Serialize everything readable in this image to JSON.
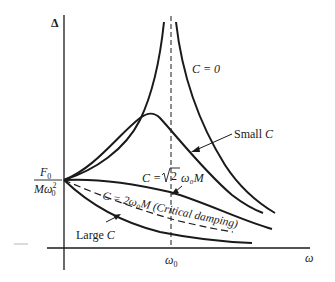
{
  "diagram": {
    "y_axis_label": "Δ",
    "x_axis_label": "ω",
    "x_tick_label": "ω",
    "x_tick_subscript": "0",
    "y_intercept_label": {
      "numerator": "F",
      "numerator_sub": "0",
      "denominator": "Mω",
      "denominator_sub": "0",
      "denominator_sup": "2"
    },
    "curves": [
      {
        "id": "c-zero",
        "label": "C = 0"
      },
      {
        "id": "small-c",
        "label": "Small C"
      },
      {
        "id": "sqrt2",
        "label_prefix": "C = ",
        "label_root": "2",
        "label_suffix": " ω₀M"
      },
      {
        "id": "critical",
        "label": "C = 2ω₀M (Critical damping)"
      },
      {
        "id": "large-c",
        "label": "Large C"
      }
    ],
    "colors": {
      "ink": "#1a1a1a",
      "background": "#ffffff"
    }
  }
}
